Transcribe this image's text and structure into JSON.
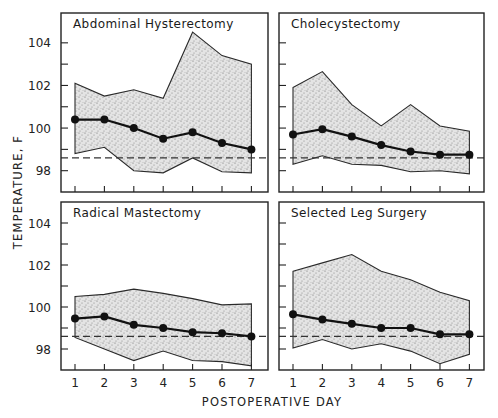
{
  "chart_data": {
    "type": "area",
    "xlabel": "POSTOPERATIVE DAY",
    "ylabel": "TEMPERATURE, F",
    "x": [
      1,
      2,
      3,
      4,
      5,
      6,
      7
    ],
    "x_tick_labels": [
      "1",
      "2",
      "3",
      "4",
      "5",
      "6",
      "7"
    ],
    "y_tick_labels": [
      "98",
      "100",
      "102",
      "104"
    ],
    "y_ticks": [
      98,
      100,
      102,
      104
    ],
    "y_minor_ticks": [
      99,
      101,
      103
    ],
    "reference_line": {
      "value": 98.6,
      "style": "dashed",
      "label": ""
    },
    "grid": false,
    "legend": "none",
    "panels": [
      {
        "title": "Abdominal Hysterectomy",
        "position": "top-left",
        "ylim": [
          97.0,
          105.4
        ],
        "series": [
          {
            "name": "upper",
            "values": [
              102.1,
              101.5,
              101.8,
              101.4,
              104.5,
              103.4,
              103.0
            ]
          },
          {
            "name": "mean",
            "values": [
              100.4,
              100.4,
              100.0,
              99.5,
              99.8,
              99.3,
              99.0
            ]
          },
          {
            "name": "lower",
            "values": [
              98.8,
              99.1,
              98.0,
              97.9,
              98.6,
              97.95,
              97.9
            ]
          }
        ]
      },
      {
        "title": "Cholecystectomy",
        "position": "top-right",
        "ylim": [
          97.0,
          105.4
        ],
        "series": [
          {
            "name": "upper",
            "values": [
              101.9,
              102.65,
              101.1,
              100.1,
              101.1,
              100.1,
              99.85
            ]
          },
          {
            "name": "mean",
            "values": [
              99.7,
              99.95,
              99.6,
              99.2,
              98.9,
              98.75,
              98.75
            ]
          },
          {
            "name": "lower",
            "values": [
              98.3,
              98.7,
              98.3,
              98.25,
              97.95,
              98.0,
              97.85
            ]
          }
        ]
      },
      {
        "title": "Radical Mastectomy",
        "position": "bottom-left",
        "ylim": [
          97.0,
          105.0
        ],
        "series": [
          {
            "name": "upper",
            "values": [
              100.5,
              100.6,
              100.85,
              100.65,
              100.4,
              100.1,
              100.15
            ]
          },
          {
            "name": "mean",
            "values": [
              99.45,
              99.55,
              99.15,
              99.0,
              98.8,
              98.75,
              98.6
            ]
          },
          {
            "name": "lower",
            "values": [
              98.55,
              98.0,
              97.45,
              97.9,
              97.45,
              97.4,
              97.2
            ]
          }
        ]
      },
      {
        "title": "Selected Leg Surgery",
        "position": "bottom-right",
        "ylim": [
          97.0,
          105.0
        ],
        "series": [
          {
            "name": "upper",
            "values": [
              101.7,
              102.1,
              102.5,
              101.7,
              101.3,
              100.7,
              100.3
            ]
          },
          {
            "name": "mean",
            "values": [
              99.65,
              99.4,
              99.2,
              99.0,
              99.0,
              98.7,
              98.7
            ]
          },
          {
            "name": "lower",
            "values": [
              98.05,
              98.45,
              98.0,
              98.25,
              97.9,
              97.3,
              97.75
            ]
          }
        ]
      }
    ]
  }
}
